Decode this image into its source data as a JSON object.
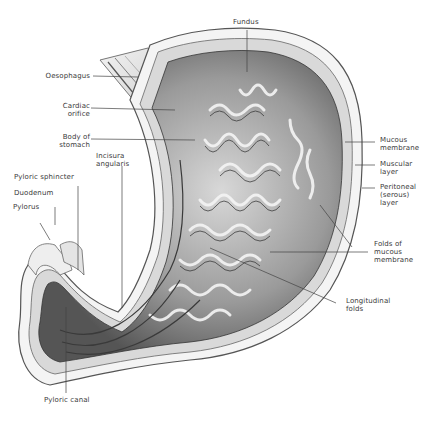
{
  "figure": {
    "labels": {
      "fundus": "Fundus",
      "oesophagus": "Oesophagus",
      "cardiac_orifice": "Cardiac\norifice",
      "body_of_stomach": "Body of\nstomach",
      "incisura_angularis": "Incisura\nangularis",
      "pyloric_sphincter": "Pyloric sphincter",
      "duodenum": "Duodenum",
      "pylorus": "Pylorus",
      "pyloric_canal": "Pyloric canal",
      "mucous_membrane": "Mucous\nmembrane",
      "muscular_layer": "Muscular\nlayer",
      "peritoneal_layer": "Peritoneal\n(serous)\nlayer",
      "folds_of_mucous_membrane": "Folds of\nmucous\nmembrane",
      "longitudinal_folds": "Longitudinal\nfolds"
    },
    "colors": {
      "background": "#ffffff",
      "label_text": "#3a3a3a",
      "leader_line": "#444444",
      "tissue_dark": "#3c3c3c",
      "tissue_mid": "#8a8a8a",
      "tissue_light": "#e6e6e6"
    }
  }
}
